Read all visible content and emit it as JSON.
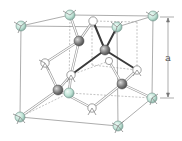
{
  "diagram": {
    "type": "crystal-structure",
    "dimension_label": "a",
    "colors": {
      "corner_atom": "#bfe3d6",
      "corner_atom_stroke": "#6f8f86",
      "interior_atom": "#7c7c7c",
      "face_atom": "#ffffff",
      "edge": "#8a8a8a",
      "hidden_edge": "#9a9a9a",
      "bond_highlight": "#333333",
      "bond": "#9a9a9a"
    },
    "corner_atoms": [
      {
        "x": 21,
        "y": 26
      },
      {
        "x": 70,
        "y": 15
      },
      {
        "x": 153,
        "y": 16
      },
      {
        "x": 117,
        "y": 27
      },
      {
        "x": 20,
        "y": 117
      },
      {
        "x": 69,
        "y": 93
      },
      {
        "x": 152,
        "y": 98
      },
      {
        "x": 118,
        "y": 126
      }
    ],
    "interior_atoms": [
      {
        "x": 79,
        "y": 41
      },
      {
        "x": 105,
        "y": 50
      },
      {
        "x": 58,
        "y": 90
      },
      {
        "x": 122,
        "y": 84
      }
    ],
    "face_atoms": [
      {
        "x": 93,
        "y": 21
      },
      {
        "x": 45,
        "y": 63
      },
      {
        "x": 71,
        "y": 75
      },
      {
        "x": 92,
        "y": 108
      },
      {
        "x": 137,
        "y": 70
      },
      {
        "x": 109,
        "y": 61
      }
    ]
  }
}
